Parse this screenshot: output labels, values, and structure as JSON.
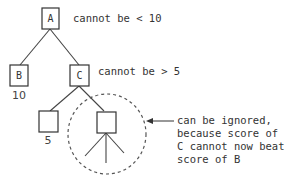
{
  "diagram": {
    "type": "game-tree-alpha-beta-pruning",
    "nodes": {
      "A": {
        "label": "A",
        "annotation": "cannot be < 10"
      },
      "B": {
        "label": "B",
        "value": "10"
      },
      "C": {
        "label": "C",
        "annotation": "cannot be > 5"
      },
      "D": {
        "label": "",
        "value": "5"
      },
      "E": {
        "label": ""
      }
    },
    "edges": [
      [
        "A",
        "B"
      ],
      [
        "A",
        "C"
      ],
      [
        "C",
        "D"
      ],
      [
        "C",
        "E"
      ]
    ],
    "pruned_region": {
      "note_lines": [
        "can be ignored,",
        "because score of",
        "C cannot now beat",
        "score of B"
      ]
    },
    "colors": {
      "ink": "#333333",
      "background": "#ffffff"
    }
  }
}
